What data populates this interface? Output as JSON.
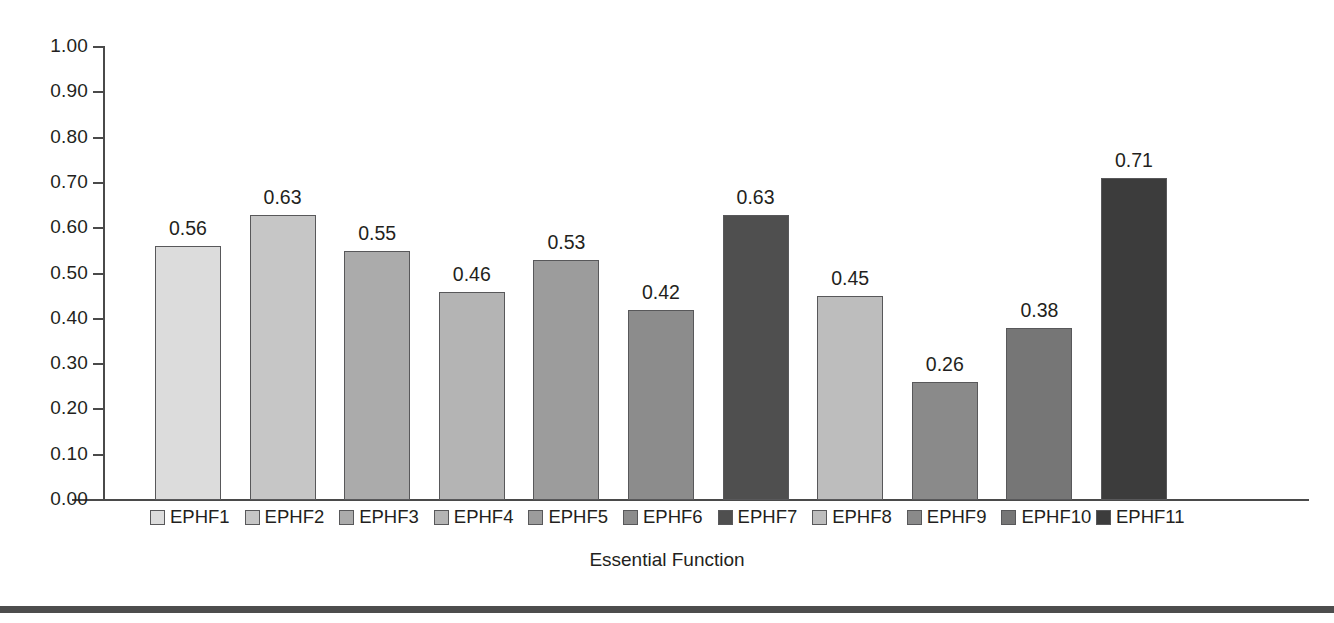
{
  "chart_data": {
    "type": "bar",
    "title": "",
    "xlabel": "Essential Function",
    "ylabel": "",
    "ylim": [
      0,
      1.0
    ],
    "ytick_step": 0.1,
    "grid": false,
    "legend_position": "bottom",
    "categories": [
      "EPHF1",
      "EPHF2",
      "EPHF3",
      "EPHF4",
      "EPHF5",
      "EPHF6",
      "EPHF7",
      "EPHF8",
      "EPHF9",
      "EPHF10",
      "EPHF11"
    ],
    "values": [
      0.56,
      0.63,
      0.55,
      0.46,
      0.53,
      0.42,
      0.63,
      0.45,
      0.26,
      0.38,
      0.71
    ],
    "value_labels": [
      "0.56",
      "0.63",
      "0.55",
      "0.46",
      "0.53",
      "0.42",
      "0.63",
      "0.45",
      "0.26",
      "0.38",
      "0.71"
    ],
    "bar_colors": [
      "#dcdcdc",
      "#c6c6c6",
      "#ababab",
      "#b4b4b4",
      "#9c9c9c",
      "#8c8c8c",
      "#4f4f4f",
      "#bdbdbd",
      "#8a8a8a",
      "#767676",
      "#3c3c3c"
    ],
    "ytick_labels": [
      "1.00",
      "0.90",
      "0.80",
      "0.70",
      "0.60",
      "0.50",
      "0.40",
      "0.30",
      "0.20",
      "0.10",
      "0.00"
    ],
    "ytick_values": [
      1.0,
      0.9,
      0.8,
      0.7,
      0.6,
      0.5,
      0.4,
      0.3,
      0.2,
      0.1,
      0.0
    ],
    "axis_color": "#4a4a4a",
    "bar_edge_color": "#58585a",
    "text_color": "#231f20"
  },
  "legend": {
    "items": [
      {
        "label": "EPHF1",
        "color": "#dcdcdc"
      },
      {
        "label": "EPHF2",
        "color": "#c6c6c6"
      },
      {
        "label": "EPHF3",
        "color": "#ababab"
      },
      {
        "label": "EPHF4",
        "color": "#b4b4b4"
      },
      {
        "label": "EPHF5",
        "color": "#9c9c9c"
      },
      {
        "label": "EPHF6",
        "color": "#8c8c8c"
      },
      {
        "label": "EPHF7",
        "color": "#4f4f4f"
      },
      {
        "label": "EPHF8",
        "color": "#bdbdbd"
      },
      {
        "label": "EPHF9",
        "color": "#8a8a8a"
      },
      {
        "label": "EPHF10",
        "color": "#767676"
      },
      {
        "label": "EPHF11",
        "color": "#3c3c3c"
      }
    ]
  },
  "footer": {
    "rule_color": "#4d4d4d"
  }
}
